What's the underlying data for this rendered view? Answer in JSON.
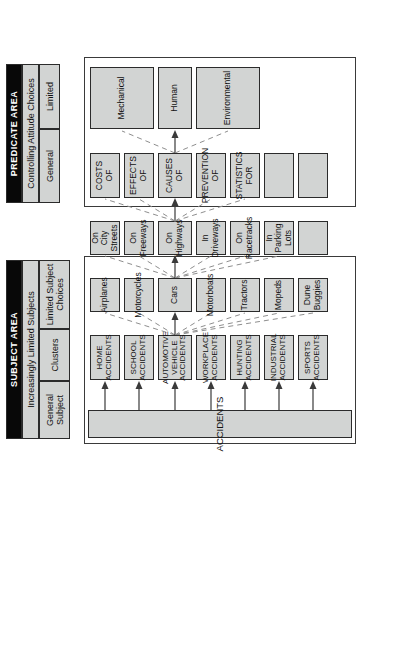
{
  "diagram": {
    "title_subject": "SUBJECT AREA",
    "title_predicate": "PREDICATE AREA",
    "subject_area": {
      "header": "SUBJECT AREA",
      "row_labels": [
        "Increasingly Limited Subjects"
      ],
      "column_labels": [
        "General Subject",
        "Clusters",
        "Limited Subject Choices"
      ],
      "general_subject": "ACCIDENTS",
      "clusters": [
        "HOME ACCIDENTS",
        "SCHOOL ACCIDENTS",
        "AUTOMOTIVE VEHICLE ACCIDENTS",
        "WORKPLACE ACCIDENTS",
        "HUNTING ACCIDENTS",
        "INDUSTRIAL ACCIDENTS",
        "SPORTS ACCIDENTS"
      ],
      "limited_subjects": [
        "Airplanes",
        "Motorcycles",
        "Cars",
        "Motorboats",
        "Tractors",
        "Mopeds",
        "Dune Buggies"
      ],
      "limited_subject_choices": [
        "On City Streets",
        "On Freeways",
        "On Highways",
        "In Driveways",
        "On Racetracks",
        "In Parking Lots",
        ""
      ]
    },
    "predicate_area": {
      "header": "PREDICATE AREA",
      "row_labels": [
        "Controlling Attitude Choices"
      ],
      "column_labels": [
        "General",
        "Limited"
      ],
      "general": [
        "COSTS OF",
        "EFFECTS OF",
        "CAUSES OF",
        "PREVENTION OF",
        "STATISTICS FOR",
        "",
        ""
      ],
      "limited": [
        "Mechanical",
        "Human",
        "Environmental"
      ]
    },
    "colors": {
      "box_fill": "#d2d4d3",
      "box_border": "#2b2b2b",
      "header_black": "#080808",
      "header_text": "#ffffff",
      "solid_connector": "#3a3a3a",
      "dashed_connector": "#8e8e8e",
      "page_background": "#ffffff"
    }
  }
}
